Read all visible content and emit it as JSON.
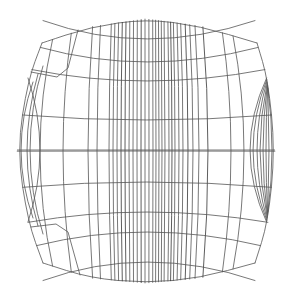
{
  "figure": {
    "width": 292,
    "height": 300,
    "background": "#ffffff",
    "stroke_color": "#555555",
    "stroke_dark": "#333333",
    "stroke_width": 0.8
  },
  "mesh": {
    "center_x": 146,
    "top_y": 19,
    "bottom_y": 283,
    "outline": {
      "top": [
        [
          42,
          43
        ],
        [
          90,
          27
        ],
        [
          146,
          19
        ],
        [
          200,
          26
        ],
        [
          257,
          43
        ]
      ],
      "bottom": [
        [
          43,
          263
        ],
        [
          90,
          278
        ],
        [
          146,
          283
        ],
        [
          200,
          278
        ],
        [
          255,
          263
        ]
      ],
      "left": [
        [
          42,
          43
        ],
        [
          28,
          80
        ],
        [
          17,
          150
        ],
        [
          28,
          222
        ],
        [
          43,
          263
        ]
      ],
      "right": [
        [
          257,
          43
        ],
        [
          268,
          80
        ],
        [
          275,
          150
        ],
        [
          268,
          222
        ],
        [
          255,
          263
        ]
      ]
    },
    "vertical_lines_mid_x": [
      40,
      63,
      88,
      97,
      109,
      113,
      117,
      121,
      125,
      129,
      133,
      137,
      141,
      145,
      149,
      153,
      156,
      159,
      162,
      165,
      169,
      172,
      175,
      179,
      183,
      188,
      193,
      199,
      208,
      231,
      244
    ],
    "horizontal_lines_center_y": [
      39,
      62,
      81,
      120,
      151,
      182,
      212,
      232,
      262
    ],
    "left_arcs_mid_x": [
      21,
      27,
      30
    ],
    "right_arcs_mid_x": [
      250,
      253,
      257,
      260,
      263,
      266,
      269,
      272
    ],
    "zigzags": [
      [
        [
          31,
          72
        ],
        [
          57,
          77
        ],
        [
          68,
          68
        ],
        [
          78,
          30
        ]
      ],
      [
        [
          31,
          227
        ],
        [
          56,
          224
        ],
        [
          68,
          232
        ],
        [
          80,
          275
        ]
      ]
    ]
  }
}
